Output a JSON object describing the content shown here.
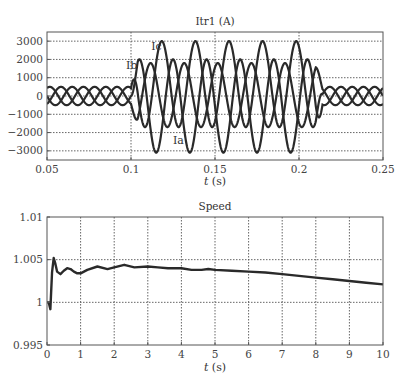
{
  "chart_data": [
    {
      "type": "line",
      "title": "Itr1 (A)",
      "xlabel": "t (s)",
      "ylabel": "",
      "xlim": [
        0.05,
        0.25
      ],
      "ylim": [
        -3500,
        3500
      ],
      "xticks": [
        0.05,
        0.1,
        0.15,
        0.2,
        0.25
      ],
      "xtick_labels": [
        "0.05",
        "0.1",
        "0.15",
        "0.2",
        "0.25"
      ],
      "yticks": [
        3000,
        2000,
        1000,
        0,
        -1000,
        -2000,
        -3000
      ],
      "ytick_labels": [
        "3000",
        "2000",
        "1000",
        "0",
        "−1000",
        "−2000",
        "−3000"
      ],
      "grid": true,
      "legend": "none (inline annotations)",
      "annotations": [
        {
          "text": "Ic",
          "x": 0.112,
          "y": 2500
        },
        {
          "text": "Ib",
          "x": 0.097,
          "y": 1500
        },
        {
          "text": "Ia",
          "x": 0.125,
          "y": -2600
        }
      ],
      "frequency_hz": 50,
      "fault_window": [
        0.1,
        0.21
      ],
      "series": [
        {
          "name": "Ia",
          "normal_amplitude": 500,
          "fault_amplitude": 2550,
          "fault_dc_offset": -550,
          "phase_deg": 0
        },
        {
          "name": "Ib",
          "normal_amplitude": 500,
          "fault_amplitude": 1750,
          "fault_dc_offset": 50,
          "phase_deg": -120
        },
        {
          "name": "Ic",
          "normal_amplitude": 500,
          "fault_amplitude": 2350,
          "fault_dc_offset": 650,
          "phase_deg": 120
        }
      ]
    },
    {
      "type": "line",
      "title": "Speed",
      "xlabel": "t (s)",
      "ylabel": "",
      "xlim": [
        0,
        10
      ],
      "ylim": [
        0.995,
        1.01
      ],
      "xticks": [
        0,
        1,
        2,
        3,
        4,
        5,
        6,
        7,
        8,
        9,
        10
      ],
      "xtick_labels": [
        "0",
        "1",
        "2",
        "3",
        "4",
        "5",
        "6",
        "7",
        "8",
        "9",
        "10"
      ],
      "yticks": [
        1.01,
        1.005,
        1,
        0.995
      ],
      "ytick_labels": [
        "1.01",
        "1.005",
        "1",
        "0.995"
      ],
      "grid": true,
      "series": [
        {
          "name": "Speed",
          "x": [
            0,
            0.05,
            0.1,
            0.15,
            0.2,
            0.25,
            0.3,
            0.4,
            0.5,
            0.6,
            0.7,
            0.8,
            0.9,
            1.0,
            1.2,
            1.5,
            1.8,
            2.0,
            2.3,
            2.6,
            3.0,
            3.3,
            3.6,
            4.0,
            4.3,
            4.6,
            4.8,
            5.0,
            5.5,
            6.0,
            6.5,
            7.0,
            7.5,
            8.0,
            8.5,
            9.0,
            9.5,
            10.0
          ],
          "y": [
            1.0,
            1.0,
            0.9992,
            1.0035,
            1.0052,
            1.0045,
            1.0036,
            1.0033,
            1.0037,
            1.004,
            1.0039,
            1.0036,
            1.0034,
            1.0034,
            1.0038,
            1.0042,
            1.0039,
            1.0041,
            1.0044,
            1.0041,
            1.0042,
            1.0041,
            1.004,
            1.004,
            1.0038,
            1.0038,
            1.0039,
            1.0038,
            1.0037,
            1.0036,
            1.0035,
            1.0033,
            1.0031,
            1.0029,
            1.0027,
            1.0025,
            1.0023,
            1.0021
          ]
        }
      ]
    }
  ],
  "charts": {
    "top": {
      "title": "Itr1 (A)",
      "xlabel_italic": "t",
      "xlabel_unit": " (s)"
    },
    "bottom": {
      "title": "Speed",
      "xlabel_italic": "t",
      "xlabel_unit": " (s)"
    }
  },
  "colors": {
    "line": "#2a2a2a",
    "grid": "#555555",
    "axis": "#555555",
    "text": "#444444"
  }
}
